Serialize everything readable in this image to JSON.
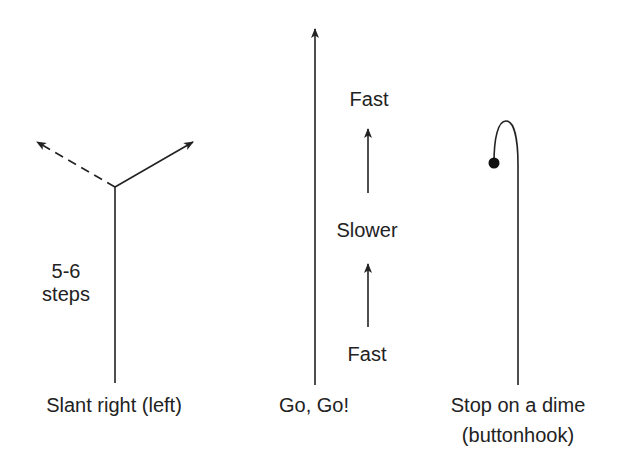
{
  "diagram": {
    "routes": [
      {
        "name": "slant",
        "annotation_lines": [
          "5-6",
          "steps"
        ],
        "label": "Slant right (left)"
      },
      {
        "name": "go",
        "speed_labels": [
          "Fast",
          "Slower",
          "Fast"
        ],
        "label": "Go, Go!"
      },
      {
        "name": "buttonhook",
        "label_lines": [
          "Stop on a dime",
          "(buttonhook)"
        ]
      }
    ],
    "colors": {
      "stroke": "#222222",
      "background": "#ffffff"
    }
  }
}
